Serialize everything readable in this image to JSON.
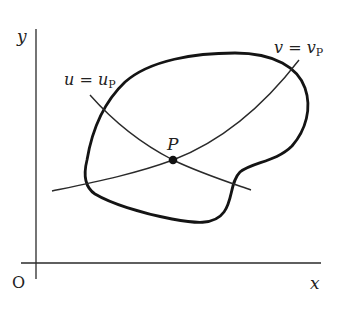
{
  "diagram": {
    "axes": {
      "x_label": "x",
      "y_label": "y",
      "origin_label": "O"
    },
    "point": {
      "label": "P"
    },
    "curves": {
      "u_curve": {
        "label_var": "u",
        "label_eq": " = ",
        "label_rhs": "u",
        "label_sub": "P"
      },
      "v_curve": {
        "label_var": "v",
        "label_eq": " = ",
        "label_rhs": "v",
        "label_sub": "P"
      }
    },
    "region": {
      "description": "closed bold boundary curve"
    },
    "colors": {
      "stroke": "#1a1a1a",
      "background": "#ffffff"
    }
  }
}
